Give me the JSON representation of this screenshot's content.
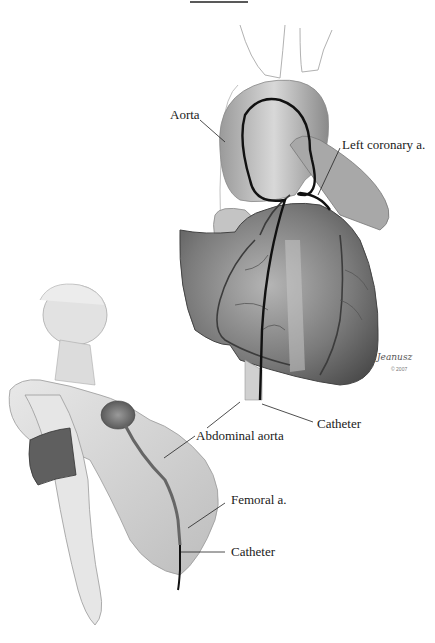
{
  "figure": {
    "type": "medical-illustration",
    "labels": {
      "aorta": "Aorta",
      "left_coronary": "Left coronary a.",
      "catheter_top": "Catheter",
      "abdominal_aorta": "Abdominal aorta",
      "femoral": "Femoral a.",
      "catheter_bottom": "Catheter"
    },
    "signature": {
      "name": "Jeanusz",
      "year": "© 2007"
    },
    "colors": {
      "line": "#111111",
      "tissue_dark": "#5a5a5a",
      "tissue_mid": "#8c8c8c",
      "tissue_light": "#cfcfcf",
      "background": "#ffffff"
    }
  }
}
